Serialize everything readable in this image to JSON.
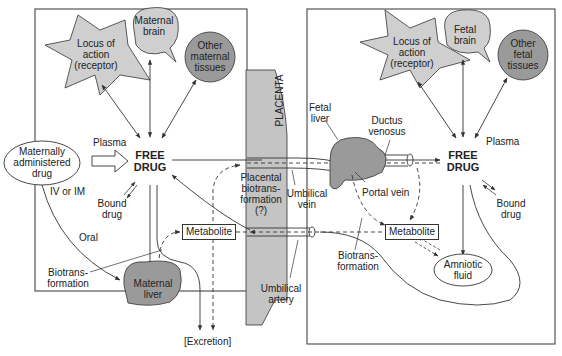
{
  "colors": {
    "shape_fill": "#cfcfcf",
    "dark_fill": "#9a9a9a",
    "placenta_fill": "#c4c4c4",
    "stroke": "#333333"
  },
  "maternal": {
    "locus": "Locus of\naction\n(receptor)",
    "brain": "Maternal\nbrain",
    "other_tissues": "Other\nmaternal\ntissues",
    "administered": "Maternally\nadministered\ndrug",
    "plasma": "Plasma",
    "free_drug": "FREE\nDRUG",
    "iv_im": "IV or IM",
    "bound_drug": "Bound\ndrug",
    "oral": "Oral",
    "biotransformation": "Biotrans-\nformation",
    "liver": "Maternal\nliver",
    "metabolite": "Metabolite",
    "excretion": "[Excretion]"
  },
  "placenta": {
    "label": "PLACENTA",
    "biotransformation": "Placental\nbiotrans-\nformation\n(?)",
    "umbilical_vein": "Umbilical\nvein",
    "umbilical_artery": "Umbilical\nartery"
  },
  "fetal": {
    "locus": "Locus of\naction\n(receptor)",
    "brain": "Fetal\nbrain",
    "other_tissues": "Other\nfetal\ntissues",
    "liver": "Fetal\nliver",
    "ductus": "Ductus\nvenosus",
    "plasma": "Plasma",
    "free_drug": "FREE\nDRUG",
    "portal_vein": "Portal vein",
    "bound_drug": "Bound\ndrug",
    "metabolite": "Metabolite",
    "biotransformation": "Biotrans-\nformation",
    "amniotic": "Amniotic\nfluid"
  }
}
